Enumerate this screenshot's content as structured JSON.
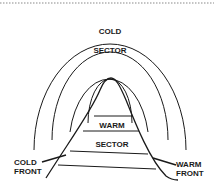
{
  "diagram": {
    "type": "cyclone-cross-section",
    "labels": {
      "cold_sector_line1": "COLD",
      "cold_sector_line2": "SECTOR",
      "warm_sector_line1": "WARM",
      "warm_sector_line2": "SECTOR",
      "cold_front_line1": "COLD",
      "cold_front_line2": "FRONT",
      "warm_front_line1": "WARM",
      "warm_front_line2": "FRONT"
    },
    "rings": 4,
    "colors": {
      "line": "#1a1a1a",
      "background": "#ffffff",
      "dotted_border": "#999999"
    }
  }
}
